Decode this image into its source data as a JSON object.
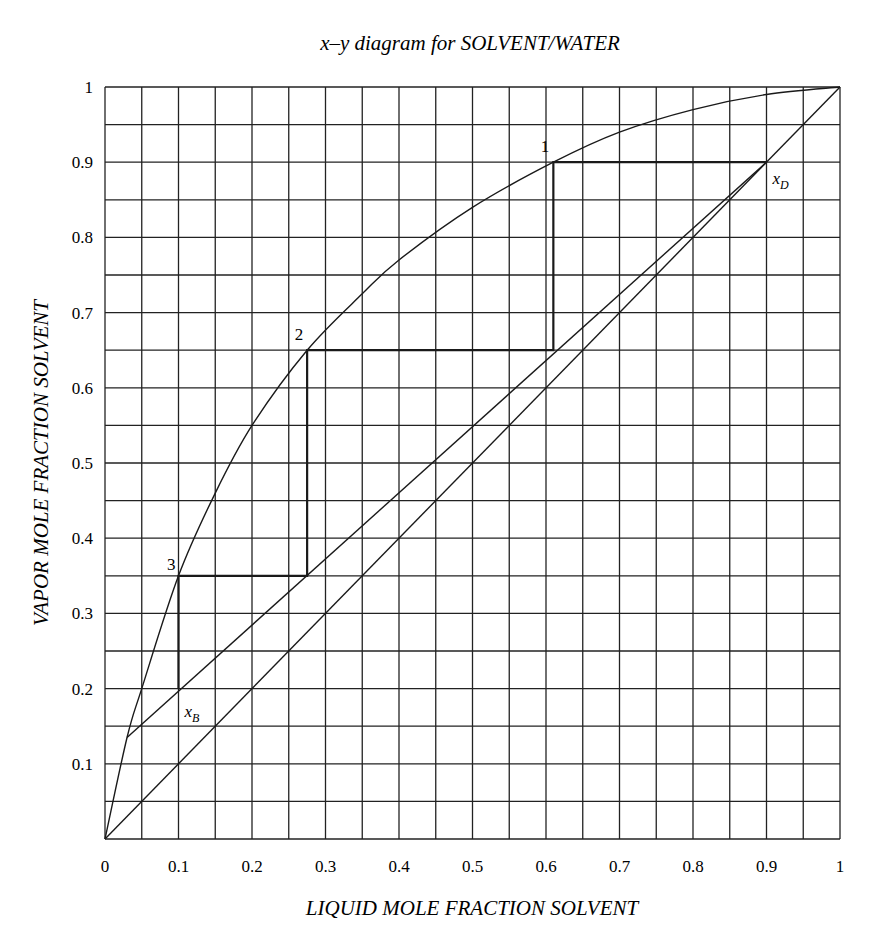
{
  "chart_data": {
    "type": "line",
    "title": "x–y diagram for SOLVENT/WATER",
    "xlabel": "LIQUID MOLE FRACTION SOLVENT",
    "ylabel": "VAPOR MOLE FRACTION SOLVENT",
    "xlim": [
      0,
      1
    ],
    "ylim": [
      0,
      1
    ],
    "grid": true,
    "grid_step": 0.05,
    "x_ticks": [
      "0",
      "0.1",
      "0.2",
      "0.3",
      "0.4",
      "0.5",
      "0.6",
      "0.7",
      "0.8",
      "0.9",
      "1"
    ],
    "y_ticks": [
      "0.1",
      "0.2",
      "0.3",
      "0.4",
      "0.5",
      "0.6",
      "0.7",
      "0.8",
      "0.9",
      "1"
    ],
    "series": [
      {
        "name": "Equilibrium curve",
        "x": [
          0,
          0.03,
          0.05,
          0.1,
          0.15,
          0.2,
          0.275,
          0.35,
          0.4,
          0.5,
          0.61,
          0.7,
          0.8,
          0.9,
          1.0
        ],
        "y": [
          0,
          0.135,
          0.2,
          0.35,
          0.46,
          0.55,
          0.65,
          0.725,
          0.77,
          0.84,
          0.9,
          0.94,
          0.97,
          0.99,
          1.0
        ]
      },
      {
        "name": "45-degree line",
        "x": [
          0,
          1
        ],
        "y": [
          0,
          1
        ]
      },
      {
        "name": "Operating line",
        "x": [
          0.03,
          0.9
        ],
        "y": [
          0.135,
          0.9
        ]
      },
      {
        "name": "Stages",
        "x": [
          0.9,
          0.61,
          0.61,
          0.275,
          0.275,
          0.1,
          0.1
        ],
        "y": [
          0.9,
          0.9,
          0.65,
          0.65,
          0.35,
          0.35,
          0.2
        ]
      }
    ],
    "annotations": [
      {
        "text": "1",
        "x": 0.61,
        "y": 0.9
      },
      {
        "text": "2",
        "x": 0.275,
        "y": 0.65
      },
      {
        "text": "3",
        "x": 0.1,
        "y": 0.35
      },
      {
        "text": "x",
        "sub": "D",
        "x": 0.9,
        "y": 0.9
      },
      {
        "text": "x",
        "sub": "B",
        "x": 0.1,
        "y": 0.2
      }
    ]
  },
  "colors": {
    "line": "#1a1a1a",
    "grid": "#222222",
    "background": "#ffffff"
  }
}
